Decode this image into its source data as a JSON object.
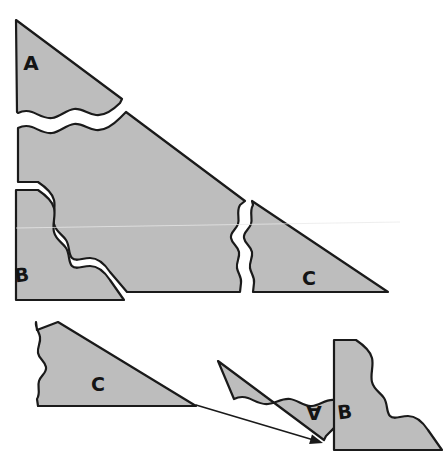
{
  "figure": {
    "background_color": "#ffffff",
    "piece_fill_color": "#bdbdbd",
    "piece_outline_color": "#1a1a1a",
    "label_color": "#141414"
  },
  "top_figure": {
    "name": "assembled-triangle",
    "description": "Large right triangle cut into four jigsaw pieces",
    "pieces": [
      {
        "id": "top-piece-a",
        "label": "A",
        "label_x": 31,
        "label_y": 64,
        "label_size": 20,
        "label_rotation": 0,
        "path": "M 16 20 L 122 99 L 120 103 C 112 111 104 116 96 115 C 88 114 82 108 74 109 C 66 110 60 117 52 118 C 44 119 38 114 32 112 C 26 110 22 111 18 113 L 17 112 Z"
      },
      {
        "id": "top-piece-center",
        "label": "",
        "label_x": 0,
        "label_y": 0,
        "label_size": 0,
        "label_rotation": 0,
        "path": "M 18 128 C 22 126 26 125 32 127 C 38 129 44 134 52 133 C 60 132 66 125 74 124 C 82 123 88 129 96 130 C 104 131 112 126 120 118 L 126 112 L 245 201 L 240 205 C 236 212 240 218 238 224 C 236 230 230 232 231 238 C 232 244 238 246 239 252 C 240 258 236 262 237 268 C 238 274 242 277 241 283 L 240 292 L 127 292 L 110 272 C 104 263 98 258 90 258 C 82 258 76 262 72 258 C 68 254 70 246 66 240 C 62 234 56 232 54 224 C 52 216 56 208 54 200 C 52 192 44 186 38 182 L 18 182 Z"
      },
      {
        "id": "top-piece-b",
        "label": "B",
        "label_x": 22,
        "label_y": 276,
        "label_size": 19,
        "label_rotation": -8,
        "path": "M 16 190 L 38 190 C 44 194 52 200 54 208 C 56 216 52 224 54 232 C 56 240 62 242 66 248 C 70 254 68 262 72 266 C 76 270 82 266 90 266 C 98 266 104 271 110 280 L 124 300 L 16 300 Z"
      },
      {
        "id": "top-piece-c",
        "label": "C",
        "label_x": 309,
        "label_y": 279,
        "label_size": 19,
        "label_rotation": 0,
        "path": "M 252 201 L 253 205 C 249 212 253 218 251 224 C 249 230 243 232 244 238 C 245 244 251 246 252 252 C 253 258 249 262 250 268 C 251 274 255 277 254 283 L 253 292 L 388 292 Z"
      }
    ]
  },
  "bottom_figure": {
    "name": "separated-pieces",
    "pieces": [
      {
        "id": "bottom-piece-c",
        "label": "C",
        "label_x": 98,
        "label_y": 385,
        "label_size": 19,
        "label_rotation": 0,
        "path": "M 58 322 L 196 406 L 38 406 L 37 399 C 41 393 37 387 39 381 C 41 375 47 373 46 367 C 45 361 39 359 38 353 C 37 347 41 343 40 337 C 39 331 35 328 36 322 L 37 330 Z"
      },
      {
        "id": "bottom-piece-a",
        "label": "A",
        "label_x": 314,
        "label_y": 411,
        "label_size": 20,
        "label_rotation": 180,
        "path": "M 218 361 L 324 440 L 326 436 C 334 428 340 423 342 415 C 344 407 338 401 334 400 C 326 399 320 405 312 406 C 304 407 298 400 290 399 C 282 398 276 403 268 404 C 260 405 254 400 248 398 C 242 396 238 397 234 399 Z"
      },
      {
        "id": "bottom-piece-b",
        "label": "B",
        "label_x": 345,
        "label_y": 413,
        "label_size": 19,
        "label_rotation": -8,
        "path": "M 334 340 L 356 340 C 362 344 370 350 372 358 C 374 366 370 374 372 382 C 374 390 380 392 384 398 C 388 404 386 412 390 416 C 394 420 400 416 408 416 C 416 416 422 421 428 430 L 442 450 L 334 450 Z"
      }
    ],
    "annotation_arrow": {
      "id": "correspondence-arrow",
      "description": "Arrow from piece C tip to piece A tip",
      "from_x": 196,
      "from_y": 405,
      "to_x": 323,
      "to_y": 443
    }
  }
}
